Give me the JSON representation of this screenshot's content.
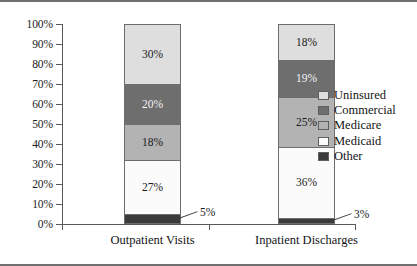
{
  "chart_data": {
    "type": "bar",
    "subtype": "stacked-bar-100-percent",
    "title": "",
    "subtitle": "",
    "xlabel": "",
    "ylabel": "",
    "categories": [
      "Outpatient Visits",
      "Inpatient Discharges"
    ],
    "ylim": [
      0,
      100
    ],
    "ytick_labels": [
      "0%",
      "10%",
      "20%",
      "30%",
      "40%",
      "50%",
      "60%",
      "70%",
      "80%",
      "90%",
      "100%"
    ],
    "ytick_values": [
      0,
      10,
      20,
      30,
      40,
      50,
      60,
      70,
      80,
      90,
      100
    ],
    "grid": false,
    "legend_position": "right",
    "stack_order_bottom_to_top": [
      "Other",
      "Medicaid",
      "Medicare",
      "Commercial",
      "Uninsured"
    ],
    "series": [
      {
        "name": "Other",
        "color": "#3b3b3b",
        "label_color": "#f2f2f2",
        "values": [
          5,
          3
        ],
        "value_labels": [
          "5%",
          "3%"
        ],
        "labels_outside": true
      },
      {
        "name": "Medicaid",
        "color": "#fbfbfb",
        "label_color": "#1b1b1b",
        "values": [
          27,
          36
        ],
        "value_labels": [
          "27%",
          "36%"
        ],
        "labels_outside": false
      },
      {
        "name": "Medicare",
        "color": "#b3b3b3",
        "label_color": "#1b1b1b",
        "values": [
          18,
          25
        ],
        "value_labels": [
          "18%",
          "25%"
        ],
        "labels_outside": false
      },
      {
        "name": "Commercial",
        "color": "#6e6e6e",
        "label_color": "#f2f2f2",
        "values": [
          20,
          19
        ],
        "value_labels": [
          "20%",
          "19%"
        ],
        "labels_outside": false
      },
      {
        "name": "Uninsured",
        "color": "#dedede",
        "label_color": "#1b1b1b",
        "values": [
          30,
          18
        ],
        "value_labels": [
          "30%",
          "18%"
        ],
        "labels_outside": false
      }
    ],
    "legend_entries": [
      {
        "label": "Uninsured",
        "color": "#dedede"
      },
      {
        "label": "Commercial",
        "color": "#6e6e6e"
      },
      {
        "label": "Medicare",
        "color": "#b3b3b3"
      },
      {
        "label": "Medicaid",
        "color": "#fbfbfb"
      },
      {
        "label": "Other",
        "color": "#3b3b3b"
      }
    ]
  },
  "axis": {
    "y_labels": [
      "100%",
      "90%",
      "80%",
      "70%",
      "60%",
      "50%",
      "40%",
      "30%",
      "20%",
      "10%",
      "0%"
    ],
    "x_labels": [
      "Outpatient Visits",
      "Inpatient Discharges"
    ]
  },
  "bars": [
    {
      "category": "Outpatient Visits",
      "segments": [
        {
          "name": "Uninsured",
          "label": "30%"
        },
        {
          "name": "Commercial",
          "label": "20%"
        },
        {
          "name": "Medicare",
          "label": "18%"
        },
        {
          "name": "Medicaid",
          "label": "27%"
        },
        {
          "name": "Other",
          "label": "5%"
        }
      ],
      "callout": "5%"
    },
    {
      "category": "Inpatient Discharges",
      "segments": [
        {
          "name": "Uninsured",
          "label": "18%"
        },
        {
          "name": "Commercial",
          "label": "19%"
        },
        {
          "name": "Medicare",
          "label": "25%"
        },
        {
          "name": "Medicaid",
          "label": "36%"
        },
        {
          "name": "Other",
          "label": "3%"
        }
      ],
      "callout": "3%"
    }
  ],
  "legend": {
    "items": [
      {
        "label": "Uninsured"
      },
      {
        "label": "Commercial"
      },
      {
        "label": "Medicare"
      },
      {
        "label": "Medicaid"
      },
      {
        "label": "Other"
      }
    ]
  }
}
